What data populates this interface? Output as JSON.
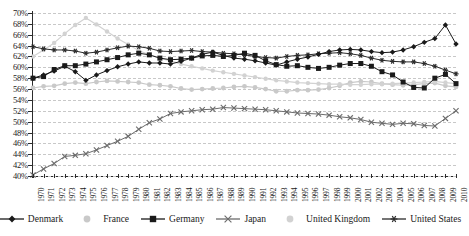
{
  "chart_data": {
    "type": "line",
    "title": "",
    "xlabel": "",
    "ylabel": "",
    "ylim": [
      40,
      70
    ],
    "ytick_step": 2,
    "grid": true,
    "legend_position": "bottom",
    "ytick_labels": [
      "70%",
      "68%",
      "66%",
      "64%",
      "62%",
      "60%",
      "58%",
      "56%",
      "54%",
      "52%",
      "50%",
      "48%",
      "46%",
      "44%",
      "42%",
      "40%"
    ],
    "categories": [
      "1970",
      "1971",
      "1972",
      "1973",
      "1974",
      "1975",
      "1976",
      "1977",
      "1978",
      "1979",
      "1980",
      "1981",
      "1982",
      "1983",
      "1984",
      "1985",
      "1986",
      "1987",
      "1988",
      "1989",
      "1990",
      "1991",
      "1992",
      "1993",
      "1994",
      "1995",
      "1996",
      "1997",
      "1998",
      "1999",
      "2000",
      "2001",
      "2002",
      "2003",
      "2004",
      "2005",
      "2006",
      "2007",
      "2008",
      "2009",
      "2010"
    ],
    "series": [
      {
        "name": "Denmark",
        "marker": "diamond",
        "color": "#1a1a1a",
        "values": [
          58.0,
          58.6,
          59.3,
          60.2,
          59.2,
          57.6,
          58.6,
          59.4,
          60.1,
          60.6,
          61.0,
          60.8,
          60.8,
          60.6,
          61.1,
          61.7,
          62.4,
          62.8,
          62.2,
          61.7,
          61.5,
          61.2,
          60.8,
          60.4,
          61.0,
          61.5,
          61.9,
          62.4,
          62.9,
          63.2,
          63.3,
          63.2,
          62.9,
          62.7,
          62.8,
          63.2,
          63.8,
          64.6,
          65.3,
          67.8,
          64.3
        ]
      },
      {
        "name": "France",
        "marker": "circle",
        "color": "#c9c9c9",
        "values": [
          56.2,
          56.5,
          56.6,
          57.0,
          57.2,
          57.0,
          57.3,
          57.5,
          57.4,
          57.3,
          57.2,
          56.8,
          56.7,
          56.5,
          56.1,
          55.9,
          56.0,
          56.1,
          56.2,
          56.4,
          56.5,
          56.3,
          56.0,
          55.6,
          55.6,
          55.8,
          55.8,
          55.9,
          56.2,
          56.6,
          57.2,
          57.4,
          57.3,
          57.0,
          56.8,
          56.7,
          56.8,
          57.0,
          57.1,
          56.6,
          56.4
        ]
      },
      {
        "name": "Germany",
        "marker": "square",
        "color": "#1a1a1a",
        "values": [
          58.0,
          58.3,
          59.6,
          60.3,
          60.3,
          60.6,
          61.0,
          61.4,
          61.8,
          62.3,
          62.6,
          62.3,
          61.7,
          61.4,
          61.5,
          61.7,
          62.1,
          62.2,
          62.0,
          62.2,
          62.6,
          62.2,
          61.2,
          60.5,
          60.2,
          60.3,
          60.0,
          59.8,
          60.0,
          60.4,
          60.7,
          60.7,
          60.2,
          59.2,
          58.6,
          57.3,
          56.3,
          56.2,
          58.0,
          58.7,
          57.0
        ]
      },
      {
        "name": "Japan",
        "marker": "cross",
        "color": "#6b6b6b",
        "values": [
          40.2,
          41.3,
          42.3,
          43.6,
          43.8,
          44.1,
          44.8,
          45.6,
          46.4,
          47.3,
          48.6,
          49.8,
          50.5,
          51.5,
          51.8,
          52.0,
          52.2,
          52.3,
          52.6,
          52.5,
          52.4,
          52.3,
          52.2,
          52.0,
          51.8,
          51.6,
          51.5,
          51.4,
          51.2,
          50.9,
          50.7,
          50.4,
          49.9,
          49.7,
          49.5,
          49.7,
          49.6,
          49.3,
          49.2,
          50.6,
          52.0
        ]
      },
      {
        "name": "United Kingdom",
        "marker": "dot",
        "color": "#d2d2d2",
        "values": [
          62.0,
          63.2,
          64.5,
          66.2,
          67.8,
          69.1,
          67.9,
          66.6,
          65.3,
          64.2,
          63.1,
          62.3,
          61.7,
          61.2,
          60.6,
          60.2,
          59.8,
          59.4,
          59.1,
          58.8,
          58.5,
          58.2,
          57.9,
          57.6,
          57.4,
          57.2,
          57.1,
          57.0,
          56.9,
          56.9,
          56.8,
          56.8,
          56.9,
          56.9,
          57.0,
          57.1,
          57.2,
          57.3,
          57.4,
          57.2,
          57.0
        ]
      },
      {
        "name": "United States",
        "marker": "asterisk",
        "color": "#2b2b2b",
        "values": [
          63.8,
          63.4,
          63.2,
          63.2,
          63.0,
          62.6,
          62.8,
          63.2,
          63.6,
          63.9,
          63.8,
          63.5,
          63.0,
          62.9,
          63.0,
          63.1,
          62.9,
          62.8,
          62.6,
          62.5,
          62.3,
          62.0,
          61.8,
          61.7,
          62.0,
          62.2,
          62.3,
          62.5,
          62.6,
          62.7,
          62.5,
          62.2,
          61.7,
          61.3,
          61.1,
          61.0,
          61.0,
          60.7,
          60.2,
          59.5,
          58.8
        ]
      }
    ]
  },
  "legend": {
    "items": [
      {
        "label": "Denmark"
      },
      {
        "label": "France"
      },
      {
        "label": "Germany"
      },
      {
        "label": "Japan"
      },
      {
        "label": "United Kingdom"
      },
      {
        "label": "United States"
      }
    ]
  }
}
